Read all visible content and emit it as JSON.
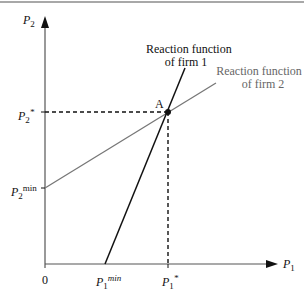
{
  "diagram": {
    "type": "reaction-functions",
    "axes": {
      "y_label": "P",
      "y_label_sub": "2",
      "x_label": "P",
      "x_label_sub": "1",
      "origin": "0"
    },
    "y_ticks": [
      {
        "name": "P2*",
        "base": "P",
        "sub": "2",
        "sup": "*"
      },
      {
        "name": "P2min",
        "base": "P",
        "sub": "2",
        "sup": "min"
      }
    ],
    "x_ticks": [
      {
        "name": "P1min",
        "base": "P",
        "sub": "1",
        "sup": "min"
      },
      {
        "name": "P1*",
        "base": "P",
        "sub": "1",
        "sup": "*"
      }
    ],
    "lines": [
      {
        "name": "Reaction function of firm 1",
        "label_line1": "Reaction function",
        "label_line2": "of firm 1",
        "color": "#111111"
      },
      {
        "name": "Reaction function of firm 2",
        "label_line1": "Reaction function",
        "label_line2": "of firm 2",
        "color": "#777777"
      }
    ],
    "equilibrium_point": {
      "label": "A"
    }
  }
}
